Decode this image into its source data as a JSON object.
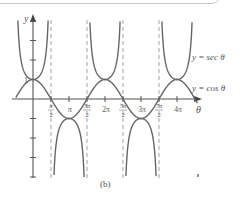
{
  "chart_data": {
    "type": "line",
    "title": "",
    "caption": "(b)",
    "xlabel": "θ",
    "ylabel": "y",
    "x_tick_labels": [
      "π/2",
      "π",
      "3π/2",
      "2π",
      "5π/2",
      "3π",
      "7π/2",
      "4π"
    ],
    "x_tick_values": [
      1.5708,
      3.1416,
      4.7124,
      6.2832,
      7.854,
      9.4248,
      10.9956,
      12.5664
    ],
    "y_tick_labels": [
      "1"
    ],
    "y_tick_values": [
      1
    ],
    "xlim": [
      -1.5,
      14.5
    ],
    "ylim": [
      -4.2,
      4
    ],
    "grid": false,
    "asymptotes": {
      "style": "dashed",
      "x": [
        1.5708,
        4.7124,
        7.854,
        10.9956
      ]
    },
    "series": [
      {
        "name": "y = sec θ",
        "function": "sec",
        "color": "#666666"
      },
      {
        "name": "y = cos θ",
        "function": "cos",
        "color": "#666666"
      }
    ],
    "annotations": [
      {
        "text": "y = sec θ",
        "near": "upper right"
      },
      {
        "text": "y = cos θ",
        "near": "right, at y≈0.5"
      }
    ]
  },
  "labels": {
    "y_axis": "y",
    "x_axis": "θ",
    "one": "1",
    "sec_label": "y = sec θ",
    "cos_label": "y = cos θ",
    "caption": "(b)",
    "ticks": {
      "t1_num": "π",
      "t1_den": "2",
      "t2": "π",
      "t3_num": "3π",
      "t3_den": "2",
      "t4": "2π",
      "t5_num": "5π",
      "t5_den": "2",
      "t6": "3π",
      "t7_num": "7π",
      "t7_den": "2",
      "t8": "4π"
    }
  }
}
